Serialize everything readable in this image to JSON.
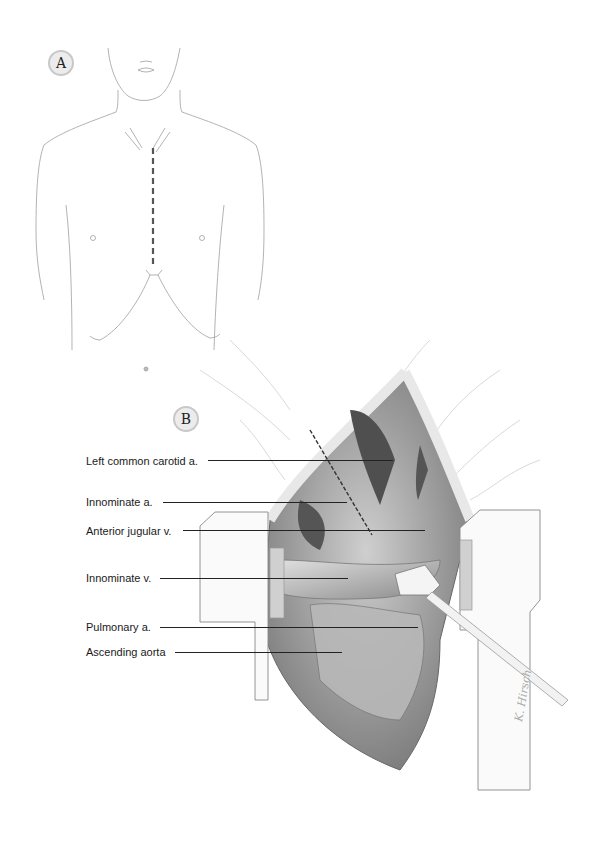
{
  "figure": {
    "panels": [
      {
        "id": "A",
        "label": "A",
        "description": "Anterior torso outline with dashed median sternotomy incision line"
      },
      {
        "id": "B",
        "label": "B",
        "description": "Opened sternotomy with retractor exposing mediastinal structures"
      }
    ],
    "labels": [
      {
        "text": "Left common carotid a.",
        "x": 86,
        "y": 455,
        "line_x1": 208,
        "line_x2": 393,
        "line_y": 460
      },
      {
        "text": "Innominate a.",
        "x": 86,
        "y": 496,
        "line_x1": 163,
        "line_x2": 347,
        "line_y": 502
      },
      {
        "text": "Anterior jugular v.",
        "x": 86,
        "y": 525,
        "line_x1": 183,
        "line_x2": 425,
        "line_y": 530
      },
      {
        "text": "Innominate v.",
        "x": 86,
        "y": 572,
        "line_x1": 160,
        "line_x2": 348,
        "line_y": 578
      },
      {
        "text": "Pulmonary a.",
        "x": 86,
        "y": 621,
        "line_x1": 160,
        "line_x2": 418,
        "line_y": 627
      },
      {
        "text": "Ascending aorta",
        "x": 86,
        "y": 646,
        "line_x1": 175,
        "line_x2": 342,
        "line_y": 652
      }
    ],
    "signature": "K. Hirsch"
  },
  "colors": {
    "ink": "#222222",
    "badge_fill": "#ececec",
    "badge_border": "#c8c8c8",
    "sketch": "#9a9a9a",
    "tissue_dark": "#555555",
    "tissue_mid": "#a8a8a8",
    "tissue_light": "#d6d6d6"
  }
}
